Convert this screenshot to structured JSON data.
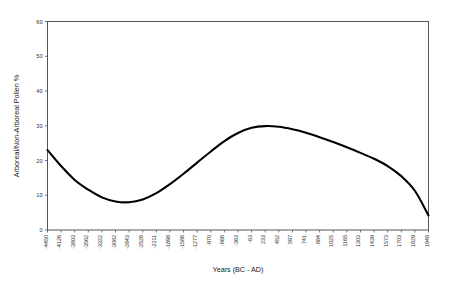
{
  "chart_data": {
    "type": "line",
    "title": "",
    "xlabel": "Years (BC - AD)",
    "ylabel": "Arboreal/Non-Arboreal Pollen %",
    "ylim": [
      0,
      60
    ],
    "yticks": [
      0,
      10,
      20,
      30,
      40,
      50,
      60
    ],
    "grid": false,
    "legend": "none",
    "categories": [
      "-4450",
      "-4126",
      "-3803",
      "-3562",
      "-3322",
      "-3082",
      "-2843",
      "-2526",
      "-2211",
      "-1898",
      "-1586",
      "-1277",
      "-970",
      "-666",
      "-363",
      "-63",
      "233",
      "452",
      "597",
      "741",
      "884",
      "1025",
      "1165",
      "1303",
      "1439",
      "1573",
      "1703",
      "1829",
      "1948"
    ],
    "values": [
      23.0,
      18.4,
      14.4,
      11.6,
      9.4,
      8.2,
      8.0,
      8.8,
      10.6,
      13.2,
      16.2,
      19.4,
      22.6,
      25.6,
      27.9,
      29.4,
      29.9,
      29.7,
      29.0,
      28.0,
      26.7,
      25.3,
      23.8,
      22.2,
      20.5,
      18.4,
      15.5,
      11.3,
      4.2
    ],
    "series_name": "Arboreal/Non-Arboreal Pollen %"
  },
  "axes": {
    "x_title": "Years (BC - AD)",
    "y_title": "Arboreal/Non-Arboreal Pollen %"
  }
}
